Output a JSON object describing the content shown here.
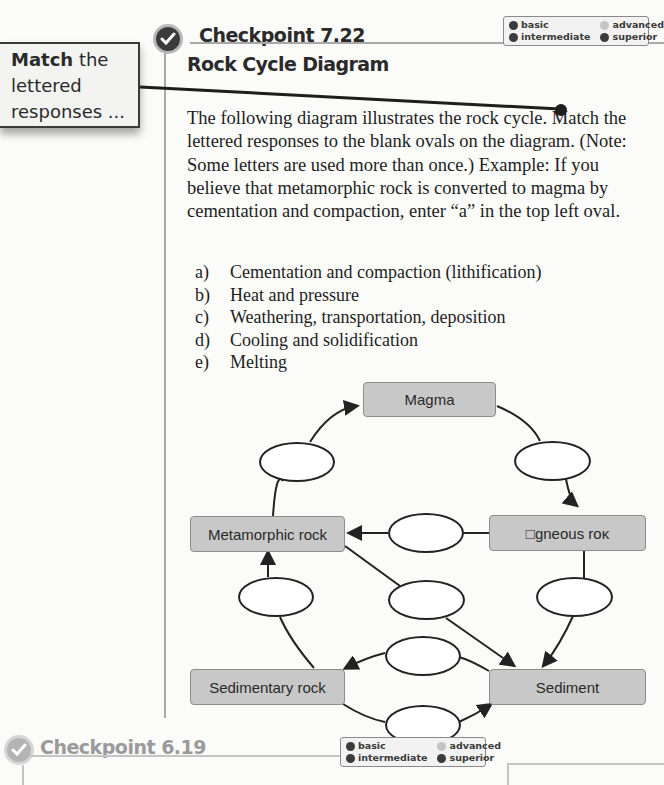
{
  "callout": {
    "bold": "Match",
    "rest_line1": " the",
    "line2": "lettered",
    "line3": "responses ..."
  },
  "checkpoint_main": {
    "title": "Checkpoint 7.22",
    "icon": "checkmark-circle-icon",
    "legend": {
      "basic": "basic",
      "advanced": "advanced",
      "intermediate": "intermediate",
      "superior": "superior"
    }
  },
  "subtitle": "Rock Cycle Diagram",
  "instructions": "The following diagram illustrates the rock cycle. Match the lettered responses to the blank ovals on the diagram. (Note: Some letters are used more than once.) Example: If you believe that metamorphic rock is converted to magma by cementation and compaction, enter “a” in the top left oval.",
  "choices": [
    {
      "letter": "a)",
      "text": "Cementation and compaction (lithification)"
    },
    {
      "letter": "b)",
      "text": "Heat and pressure"
    },
    {
      "letter": "c)",
      "text": "Weathering, transportation, deposition"
    },
    {
      "letter": "d)",
      "text": "Cooling and solidification"
    },
    {
      "letter": "e)",
      "text": "Melting"
    }
  ],
  "diagram": {
    "nodes": {
      "magma": "Magma",
      "metamorphic": "Metamorphic rock",
      "igneous": "□gneous roĸ",
      "sedimentary": "Sedimentary rock",
      "sediment": "Sediment"
    },
    "ovals": [
      {
        "id": "metamorphic-to-magma",
        "value": ""
      },
      {
        "id": "magma-to-igneous",
        "value": ""
      },
      {
        "id": "igneous-to-metamorphic",
        "value": ""
      },
      {
        "id": "sedimentary-to-metamorphic",
        "value": ""
      },
      {
        "id": "metamorphic-to-sediment",
        "value": ""
      },
      {
        "id": "igneous-to-sediment",
        "value": ""
      },
      {
        "id": "sediment-to-sedimentary",
        "value": ""
      },
      {
        "id": "sedimentary-to-sediment",
        "value": ""
      }
    ]
  },
  "checkpoint_next": {
    "title": "Checkpoint 6.19",
    "icon": "checkmark-circle-icon",
    "legend": {
      "basic": "basic",
      "advanced": "advanced",
      "intermediate": "intermediate",
      "superior": "superior"
    }
  }
}
